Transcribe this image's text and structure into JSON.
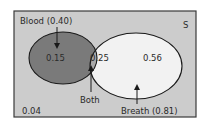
{
  "diagram": {
    "type": "venn",
    "universe_label": "S",
    "sets": [
      {
        "name": "Blood",
        "label": "Blood (0.40)",
        "probability": 0.4
      },
      {
        "name": "Breath",
        "label": "Breath (0.81)",
        "probability": 0.81
      }
    ],
    "regions": {
      "blood_only": "0.15",
      "both": "0.25",
      "breath_only": "0.56",
      "neither": "0.04"
    },
    "annotations": {
      "both_label": "Both"
    },
    "colors": {
      "universe_fill": "#cccccc",
      "blood_only_fill": "#7a7a7a",
      "both_fill": "#a8a8a8",
      "breath_only_fill": "#f2f2f2",
      "stroke": "#1a1a1a"
    }
  }
}
